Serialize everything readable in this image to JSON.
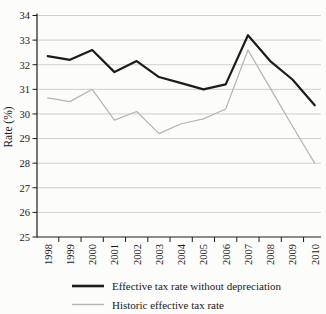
{
  "chart_data": {
    "type": "line",
    "title": "",
    "xlabel": "",
    "ylabel": "Rate (%)",
    "ylim": [
      25,
      34
    ],
    "yticks": [
      25,
      26,
      27,
      28,
      29,
      30,
      31,
      32,
      33,
      34
    ],
    "grid": "horizontal",
    "legend_position": "bottom",
    "categories": [
      "1998",
      "1999",
      "2000",
      "2001",
      "2002",
      "2003",
      "2004",
      "2005",
      "2006",
      "2007",
      "2008",
      "2009",
      "2010"
    ],
    "series": [
      {
        "name": "Effective tax rate without depreciation",
        "color": "#1c1c1c",
        "width": 2.2,
        "values": [
          32.35,
          32.2,
          32.6,
          31.7,
          32.15,
          31.5,
          31.25,
          31.0,
          31.2,
          33.2,
          32.15,
          31.4,
          30.35
        ]
      },
      {
        "name": "Historic effective tax rate",
        "color": "#b4b4b4",
        "width": 1.2,
        "values": [
          30.65,
          30.5,
          31.0,
          29.75,
          30.1,
          29.2,
          29.6,
          29.8,
          30.2,
          32.6,
          31.05,
          29.5,
          28.0
        ]
      }
    ]
  },
  "axis": {
    "color": "#1c1c1c",
    "grid_color": "#c9c9c9",
    "text_color": "#1a1a1a"
  }
}
